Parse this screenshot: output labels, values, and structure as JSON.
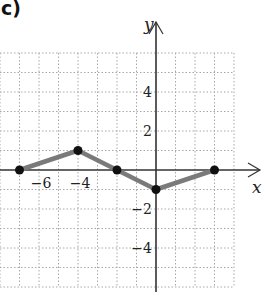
{
  "panel_label": "c)",
  "chart_data": {
    "type": "line",
    "title": "",
    "xlabel": "x",
    "ylabel": "y",
    "x_ticks_labeled": [
      -6,
      -4
    ],
    "y_ticks_labeled": [
      4,
      2,
      -2,
      -4
    ],
    "x_tick_labels": [
      "−6",
      "−4"
    ],
    "y_tick_labels": [
      "4",
      "2",
      "−2",
      "−4"
    ],
    "xlim": [
      -8,
      4
    ],
    "ylim": [
      -6,
      6
    ],
    "grid": true,
    "grid_style": "dotted",
    "series": [
      {
        "name": "f",
        "points": [
          [
            -7,
            0
          ],
          [
            -4,
            1
          ],
          [
            -2,
            0
          ],
          [
            0,
            -1
          ],
          [
            3,
            0
          ]
        ],
        "x": [
          -7,
          -4,
          -2,
          0,
          3
        ],
        "y": [
          0,
          1,
          0,
          -1,
          0
        ],
        "line_color": "#7a7a7a",
        "marker_color": "#111111"
      }
    ]
  },
  "colors": {
    "axis": "#333333",
    "grid": "#a8a8a8",
    "line": "#7a7a7a",
    "marker": "#111111"
  }
}
